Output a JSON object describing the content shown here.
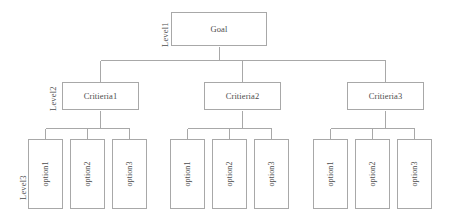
{
  "diagram": {
    "type": "hierarchy-tree",
    "line_color": "#a8a8a8",
    "text_color": "#4d4d4d",
    "background": "#ffffff",
    "levels": [
      {
        "label": "Level1",
        "rotated": true
      },
      {
        "label": "Level2",
        "rotated": true
      },
      {
        "label": "Level3",
        "rotated": true
      }
    ],
    "goal": {
      "label": "Goal"
    },
    "criteria": [
      {
        "label": "Critieria1"
      },
      {
        "label": "Critieria2"
      },
      {
        "label": "Critieria3"
      }
    ],
    "alternatives": {
      "criteria1": [
        {
          "label": "option1"
        },
        {
          "label": "option2"
        },
        {
          "label": "option3"
        }
      ],
      "criteria2": [
        {
          "label": "option1"
        },
        {
          "label": "option2"
        },
        {
          "label": "option3"
        }
      ],
      "criteria3": [
        {
          "label": "option1"
        },
        {
          "label": "option2"
        },
        {
          "label": "option3"
        }
      ]
    }
  }
}
